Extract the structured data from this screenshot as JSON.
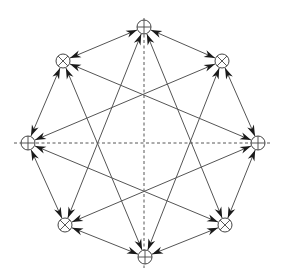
{
  "diagram": {
    "type": "octagram-network",
    "colors": {
      "line": "#555555",
      "arrow": "#1a1a1a",
      "axis": "#444444",
      "node": "#444444",
      "background": "#ffffff"
    },
    "node_radius": 7,
    "axes": {
      "horizontal": {
        "x1": 14,
        "y1": 143,
        "x2": 272,
        "y2": 143
      },
      "vertical": {
        "x1": 144,
        "y1": 18,
        "x2": 144,
        "y2": 268
      }
    },
    "nodes": [
      {
        "id": "top",
        "x": 144,
        "y": 27,
        "symbol": "plus"
      },
      {
        "id": "top-right",
        "x": 222,
        "y": 61,
        "symbol": "cross"
      },
      {
        "id": "right",
        "x": 258,
        "y": 143,
        "symbol": "plus"
      },
      {
        "id": "bottom-right",
        "x": 225,
        "y": 225,
        "symbol": "cross"
      },
      {
        "id": "bottom",
        "x": 145,
        "y": 257,
        "symbol": "plus"
      },
      {
        "id": "bottom-left",
        "x": 65,
        "y": 225,
        "symbol": "cross"
      },
      {
        "id": "left",
        "x": 28,
        "y": 143,
        "symbol": "plus"
      },
      {
        "id": "top-left",
        "x": 63,
        "y": 61,
        "symbol": "cross"
      }
    ],
    "edges": [
      {
        "from": 0,
        "to": 1,
        "kind": "ring"
      },
      {
        "from": 1,
        "to": 2,
        "kind": "ring"
      },
      {
        "from": 2,
        "to": 3,
        "kind": "ring"
      },
      {
        "from": 3,
        "to": 4,
        "kind": "ring"
      },
      {
        "from": 4,
        "to": 5,
        "kind": "ring"
      },
      {
        "from": 5,
        "to": 6,
        "kind": "ring"
      },
      {
        "from": 6,
        "to": 7,
        "kind": "ring"
      },
      {
        "from": 7,
        "to": 0,
        "kind": "ring"
      },
      {
        "from": 0,
        "to": 3,
        "kind": "star"
      },
      {
        "from": 0,
        "to": 5,
        "kind": "star"
      },
      {
        "from": 1,
        "to": 4,
        "kind": "star"
      },
      {
        "from": 1,
        "to": 6,
        "kind": "star"
      },
      {
        "from": 2,
        "to": 5,
        "kind": "star"
      },
      {
        "from": 2,
        "to": 7,
        "kind": "star"
      },
      {
        "from": 3,
        "to": 6,
        "kind": "star"
      },
      {
        "from": 4,
        "to": 7,
        "kind": "star"
      }
    ],
    "arrowheads": "both"
  }
}
